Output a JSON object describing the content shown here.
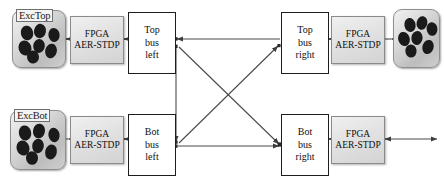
{
  "figure": {
    "colors": {
      "wire": "#4a4a4a",
      "bus_border": "#1d1d1d",
      "fpga_fill": "#e2e2e2",
      "cluster_fill": "#cfcfcf",
      "neuron": "#1a1a1a",
      "background": "#ffffff"
    }
  },
  "clusters": [
    {
      "id": "exc-top-left",
      "label": "ExcTop",
      "has_label": true,
      "x": 12,
      "y": 10,
      "w": 52,
      "h": 56,
      "neurons": [
        {
          "cx": 14,
          "cy": 22,
          "rx": 6.2,
          "ry": 7.4,
          "rot": -12
        },
        {
          "cx": 27,
          "cy": 20,
          "rx": 6.0,
          "ry": 7.2,
          "rot": 10
        },
        {
          "cx": 41,
          "cy": 24,
          "rx": 5.6,
          "ry": 7.0,
          "rot": -8
        },
        {
          "cx": 12,
          "cy": 37,
          "rx": 6.4,
          "ry": 7.6,
          "rot": -18
        },
        {
          "cx": 26,
          "cy": 35,
          "rx": 5.8,
          "ry": 7.0,
          "rot": 6
        },
        {
          "cx": 20,
          "cy": 46,
          "rx": 6.0,
          "ry": 6.6,
          "rot": -5
        },
        {
          "cx": 38,
          "cy": 40,
          "rx": 5.8,
          "ry": 7.4,
          "rot": 14
        }
      ]
    },
    {
      "id": "exc-bot-left",
      "label": "ExcBot",
      "has_label": true,
      "x": 10,
      "y": 110,
      "w": 54,
      "h": 58,
      "neurons": [
        {
          "cx": 14,
          "cy": 22,
          "rx": 6.2,
          "ry": 7.6,
          "rot": -12
        },
        {
          "cx": 28,
          "cy": 20,
          "rx": 6.0,
          "ry": 7.4,
          "rot": 10
        },
        {
          "cx": 43,
          "cy": 24,
          "rx": 5.6,
          "ry": 7.2,
          "rot": -8
        },
        {
          "cx": 12,
          "cy": 37,
          "rx": 6.4,
          "ry": 7.6,
          "rot": -18
        },
        {
          "cx": 27,
          "cy": 35,
          "rx": 5.8,
          "ry": 7.2,
          "rot": 6
        },
        {
          "cx": 21,
          "cy": 47,
          "rx": 6.0,
          "ry": 6.8,
          "rot": -5
        },
        {
          "cx": 40,
          "cy": 41,
          "rx": 5.8,
          "ry": 7.6,
          "rot": 14
        }
      ]
    },
    {
      "id": "exc-top-right",
      "label": "",
      "has_label": false,
      "x": 393,
      "y": 9,
      "w": 45,
      "h": 57,
      "neurons": [
        {
          "cx": 16,
          "cy": 15,
          "rx": 5.6,
          "ry": 7.0,
          "rot": -10
        },
        {
          "cx": 28,
          "cy": 13,
          "rx": 5.4,
          "ry": 6.8,
          "rot": 12
        },
        {
          "cx": 38,
          "cy": 19,
          "rx": 5.4,
          "ry": 6.8,
          "rot": -6
        },
        {
          "cx": 10,
          "cy": 29,
          "rx": 5.8,
          "ry": 7.2,
          "rot": -16
        },
        {
          "cx": 23,
          "cy": 28,
          "rx": 5.6,
          "ry": 7.0,
          "rot": 8
        },
        {
          "cx": 17,
          "cy": 41,
          "rx": 5.6,
          "ry": 6.6,
          "rot": -4
        },
        {
          "cx": 34,
          "cy": 37,
          "rx": 5.6,
          "ry": 7.2,
          "rot": 16
        }
      ]
    }
  ],
  "fpga_blocks": [
    {
      "id": "fpga-top-left",
      "line1": "FPGA",
      "line2": "AER-STDP",
      "x": 70,
      "y": 16,
      "w": 52,
      "h": 46
    },
    {
      "id": "fpga-top-right",
      "line1": "FPGA",
      "line2": "AER-STDP",
      "x": 331,
      "y": 16,
      "w": 52,
      "h": 46
    },
    {
      "id": "fpga-bot-left",
      "line1": "FPGA",
      "line2": "AER-STDP",
      "x": 70,
      "y": 116,
      "w": 52,
      "h": 46
    },
    {
      "id": "fpga-bot-right",
      "line1": "FPGA",
      "line2": "AER-STDP",
      "x": 331,
      "y": 116,
      "w": 52,
      "h": 46
    }
  ],
  "bus_blocks": [
    {
      "id": "top-bus-left",
      "line1": "Top",
      "line2": "bus",
      "line3": "left",
      "x": 128,
      "y": 12,
      "w": 46,
      "h": 60
    },
    {
      "id": "top-bus-right",
      "line1": "Top",
      "line2": "bus",
      "line3": "right",
      "x": 281,
      "y": 12,
      "w": 46,
      "h": 60
    },
    {
      "id": "bot-bus-left",
      "line1": "Bot",
      "line2": "bus",
      "line3": "left",
      "x": 128,
      "y": 114,
      "w": 46,
      "h": 60
    },
    {
      "id": "bot-bus-right",
      "line1": "Bot",
      "line2": "bus",
      "line3": "right",
      "x": 281,
      "y": 114,
      "w": 46,
      "h": 60
    }
  ],
  "connections": [
    {
      "id": "exc-top-to-fpga-top-left",
      "from": "exc-top-left",
      "to": "fpga-top-left",
      "kind": "horizontal",
      "direction": "both"
    },
    {
      "id": "fpga-top-left-to-bus",
      "from": "fpga-top-left",
      "to": "top-bus-left",
      "kind": "horizontal",
      "direction": "both"
    },
    {
      "id": "bus-top-right-to-fpga",
      "from": "top-bus-right",
      "to": "fpga-top-right",
      "kind": "horizontal",
      "direction": "both"
    },
    {
      "id": "fpga-top-right-to-exc",
      "from": "fpga-top-right",
      "to": "exc-top-right",
      "kind": "horizontal",
      "direction": "both"
    },
    {
      "id": "exc-bot-to-fpga-bot-left",
      "from": "exc-bot-left",
      "to": "fpga-bot-left",
      "kind": "horizontal",
      "direction": "both"
    },
    {
      "id": "fpga-bot-left-to-bus",
      "from": "fpga-bot-left",
      "to": "bot-bus-left",
      "kind": "horizontal",
      "direction": "both"
    },
    {
      "id": "bus-bot-right-to-fpga",
      "from": "bot-bus-right",
      "to": "fpga-bot-right",
      "kind": "horizontal",
      "direction": "both"
    },
    {
      "id": "fpga-bot-right-output",
      "from": "fpga-bot-right",
      "to": "external",
      "kind": "horizontal",
      "direction": "both"
    },
    {
      "id": "top-right-to-top-left",
      "from": "top-bus-right",
      "to": "top-bus-left",
      "kind": "horizontal",
      "direction": "left"
    },
    {
      "id": "bot-left-to-bot-right",
      "from": "bot-bus-left",
      "to": "bot-bus-right",
      "kind": "horizontal",
      "direction": "right"
    },
    {
      "id": "top-left-to-bot-right",
      "from": "top-bus-left",
      "to": "bot-bus-right",
      "kind": "diagonal",
      "direction": "right"
    },
    {
      "id": "bot-left-to-top-right",
      "from": "bot-bus-left",
      "to": "top-bus-right",
      "kind": "diagonal",
      "direction": "right"
    },
    {
      "id": "top-left-down-to-bot-left",
      "from": "top-bus-left",
      "to": "bot-bus-left",
      "kind": "vertical",
      "direction": "down"
    }
  ]
}
